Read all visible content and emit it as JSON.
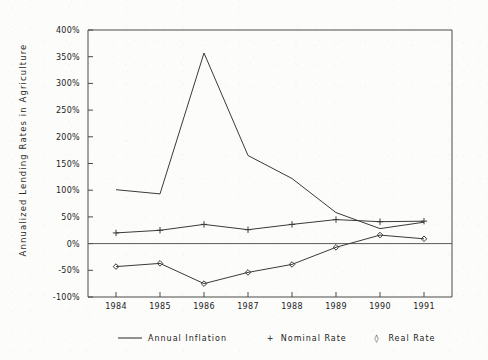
{
  "chart_data": {
    "type": "line",
    "title": "",
    "xlabel": "",
    "ylabel": "Annualized Lending Rates in Agriculture",
    "categories": [
      "1984",
      "1985",
      "1986",
      "1987",
      "1988",
      "1989",
      "1990",
      "1991"
    ],
    "x": [
      1984,
      1985,
      1986,
      1987,
      1988,
      1989,
      1990,
      1991
    ],
    "ylim": [
      -100,
      400
    ],
    "yticks": [
      -100,
      -50,
      0,
      50,
      100,
      150,
      200,
      250,
      300,
      350,
      400
    ],
    "ytick_labels": [
      "-100%",
      "-50%",
      "0%",
      "50%",
      "100%",
      "150%",
      "200%",
      "250%",
      "300%",
      "350%",
      "400%"
    ],
    "grid": false,
    "legend_position": "bottom",
    "zero_line": true,
    "series": [
      {
        "name": "Annual Inflation",
        "marker": "none",
        "values": [
          101,
          93,
          357,
          165,
          122,
          58,
          28,
          40
        ]
      },
      {
        "name": "Nominal Rate",
        "marker": "+",
        "values": [
          20,
          25,
          36,
          26,
          36,
          45,
          41,
          42
        ]
      },
      {
        "name": "Real Rate",
        "marker": "diamond",
        "values": [
          -43,
          -37,
          -75,
          -54,
          -39,
          -7,
          16,
          9
        ]
      }
    ]
  },
  "legend": {
    "entries": [
      {
        "label": "Annual Inflation",
        "glyph": "line"
      },
      {
        "label": "Nominal Rate",
        "glyph": "+"
      },
      {
        "label": "Real Rate",
        "glyph": "◊"
      }
    ]
  },
  "colors": {
    "background": "#fcfcfa",
    "ink": "#3a3a3a",
    "axis": "#4a4a4a",
    "text": "#232323"
  }
}
